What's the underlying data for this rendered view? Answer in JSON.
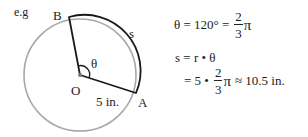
{
  "example_label": "e.g",
  "diagram": {
    "points": {
      "B": "B",
      "O": "O",
      "A": "A"
    },
    "arc_label": "s",
    "angle_label": "θ",
    "radius_label": "5 in.",
    "colors": {
      "circle": "#a8a8a8",
      "sector": "#1a1a1a",
      "vertex": "#777777"
    }
  },
  "equations": {
    "line1": {
      "lhs": "θ = 120° =",
      "frac_num": "2",
      "frac_den": "3",
      "suffix": "π"
    },
    "line2": {
      "text": "s = r • θ"
    },
    "line3": {
      "prefix": "= 5 •",
      "frac_num": "2",
      "frac_den": "3",
      "suffix": "π",
      "approx": "≈ 10.5 in."
    }
  }
}
